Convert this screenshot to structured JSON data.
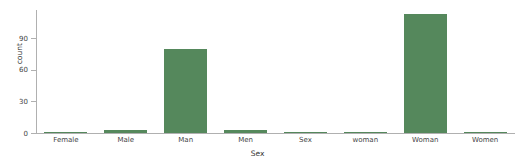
{
  "chart_data": {
    "type": "bar",
    "title": "",
    "xlabel": "Sex",
    "ylabel": "count",
    "categories": [
      "Female",
      "Male",
      "Man",
      "Men",
      "Sex",
      "woman",
      "Woman",
      "Women"
    ],
    "values": [
      1,
      3,
      80,
      3,
      1,
      1,
      113,
      1
    ],
    "series": [
      {
        "name": "count",
        "values": [
          1,
          3,
          80,
          3,
          1,
          1,
          113,
          1
        ]
      }
    ],
    "ylim": [
      0,
      117
    ],
    "yticks": [
      0,
      30,
      60,
      90
    ],
    "ytick_labels": [
      "0",
      "30",
      "60",
      "90"
    ],
    "xtick_labels": [
      "Female",
      "Male",
      "Man",
      "Men",
      "Sex",
      "woman",
      "Woman",
      "Women"
    ],
    "grid": false,
    "legend": false,
    "legend_position": "none",
    "bar_color": "#55885c",
    "axis_color": "#b0b0b0",
    "text_color": "#444444"
  }
}
